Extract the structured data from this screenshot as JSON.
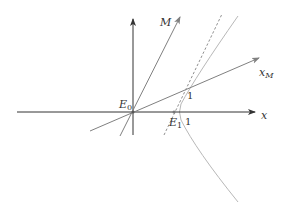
{
  "diagram": {
    "type": "spacetime-diagram",
    "labels": {
      "x_axis": "x",
      "m_axis": "M",
      "xm_axis_base": "x",
      "xm_axis_sub": "M",
      "origin_base": "E",
      "origin_sub": "0",
      "event1_base": "E",
      "event1_sub": "1",
      "unit_on_x": "1",
      "unit_on_xm": "1"
    },
    "colors": {
      "axis": "#333333",
      "boosted_axis": "#808080",
      "dashed_line": "#909090",
      "hyperbola": "#b8b8b8",
      "text": "#333333"
    }
  }
}
